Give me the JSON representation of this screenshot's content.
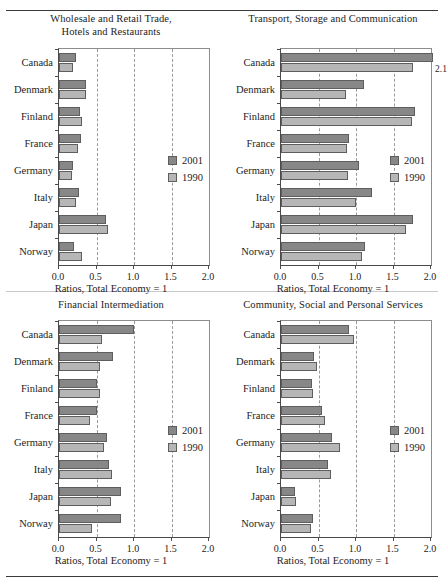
{
  "figure": {
    "axis_title": "Ratios, Total Economy = 1",
    "categories": [
      "Canada",
      "Denmark",
      "Finland",
      "France",
      "Germany",
      "Italy",
      "Japan",
      "Norway"
    ],
    "xticks": [
      "0.0",
      "0.5",
      "1.0",
      "1.5",
      "2.0"
    ],
    "xtick_values": [
      0.0,
      0.5,
      1.0,
      1.5,
      2.0
    ],
    "legend": [
      {
        "name": "2001",
        "color": "#878787"
      },
      {
        "name": "1990",
        "color": "#b6b6b6"
      }
    ],
    "colors": {
      "series_2001": "#878787",
      "series_1990": "#b6b6b6",
      "axis": "#4a4a4a",
      "grid": "#9a9a9a"
    }
  },
  "chart_data": [
    {
      "type": "bar",
      "title": "Wholesale and Retail Trade, Hotels and Restaurants",
      "title_line1": "Wholesale and Retail Trade,",
      "title_line2": "Hotels and Restaurants",
      "orientation": "horizontal",
      "xlabel": "Ratios, Total Economy = 1",
      "ylabel": "",
      "xlim": [
        0.0,
        2.0
      ],
      "grid": true,
      "legend_position": "right",
      "categories": [
        "Canada",
        "Denmark",
        "Finland",
        "France",
        "Germany",
        "Italy",
        "Japan",
        "Norway"
      ],
      "series": [
        {
          "name": "2001",
          "values": [
            0.22,
            0.36,
            0.28,
            0.29,
            0.18,
            0.26,
            0.63,
            0.2
          ]
        },
        {
          "name": "1990",
          "values": [
            0.18,
            0.36,
            0.31,
            0.25,
            0.17,
            0.22,
            0.65,
            0.31
          ]
        }
      ]
    },
    {
      "type": "bar",
      "title": "Transport, Storage and Communication",
      "title_line1": "Transport, Storage and Communication",
      "title_line2": "",
      "orientation": "horizontal",
      "xlabel": "Ratios, Total Economy = 1",
      "ylabel": "",
      "xlim": [
        0.0,
        2.0
      ],
      "grid": true,
      "legend_position": "right",
      "categories": [
        "Canada",
        "Denmark",
        "Finland",
        "France",
        "Germany",
        "Italy",
        "Japan",
        "Norway"
      ],
      "series": [
        {
          "name": "2001",
          "values": [
            2.1,
            1.1,
            1.79,
            0.9,
            1.04,
            1.21,
            1.76,
            1.12
          ]
        },
        {
          "name": "1990",
          "values": [
            1.76,
            0.87,
            1.74,
            0.88,
            0.89,
            1.0,
            1.67,
            1.08
          ]
        }
      ],
      "annotations": [
        {
          "text": "2.1",
          "category": "Canada",
          "series": "2001"
        }
      ]
    },
    {
      "type": "bar",
      "title": "Financial Intermediation",
      "title_line1": "Financial Intermediation",
      "title_line2": "",
      "orientation": "horizontal",
      "xlabel": "Ratios, Total Economy = 1",
      "ylabel": "",
      "xlim": [
        0.0,
        2.0
      ],
      "grid": true,
      "legend_position": "right",
      "categories": [
        "Canada",
        "Denmark",
        "Finland",
        "France",
        "Germany",
        "Italy",
        "Japan",
        "Norway"
      ],
      "series": [
        {
          "name": "2001",
          "values": [
            1.0,
            0.72,
            0.5,
            0.5,
            0.64,
            0.66,
            0.82,
            0.82
          ]
        },
        {
          "name": "1990",
          "values": [
            0.57,
            0.55,
            0.55,
            0.41,
            0.6,
            0.71,
            0.69,
            0.44
          ]
        }
      ]
    },
    {
      "type": "bar",
      "title": "Community, Social and Personal Services",
      "title_line1": "Community, Social and Personal Services",
      "title_line2": "",
      "orientation": "horizontal",
      "xlabel": "Ratios, Total Economy = 1",
      "ylabel": "",
      "xlim": [
        0.0,
        2.0
      ],
      "grid": true,
      "legend_position": "right",
      "categories": [
        "Canada",
        "Denmark",
        "Finland",
        "France",
        "Germany",
        "Italy",
        "Japan",
        "Norway"
      ],
      "series": [
        {
          "name": "2001",
          "values": [
            0.91,
            0.44,
            0.41,
            0.54,
            0.68,
            0.62,
            0.18,
            0.43
          ]
        },
        {
          "name": "1990",
          "values": [
            0.97,
            0.48,
            0.42,
            0.58,
            0.78,
            0.67,
            0.2,
            0.4
          ]
        }
      ]
    }
  ]
}
